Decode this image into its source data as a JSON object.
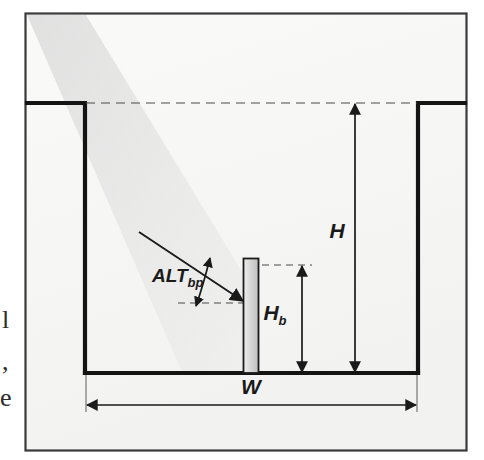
{
  "figure": {
    "background_color": "#ffffff",
    "frame_color": "#2b2b2b",
    "ink_color": "#1a1a1a",
    "sunbeam_color": "#e2e2e2",
    "building_fill_color": "#cfcfcf",
    "paper_tint": "#f6f6f4"
  },
  "labels": {
    "canyon_height": {
      "symbol": "H",
      "subscript": "",
      "name": "canyon height"
    },
    "building_height": {
      "symbol": "H",
      "subscript": "b",
      "name": "building height"
    },
    "canyon_width": {
      "symbol": "W",
      "subscript": "",
      "name": "canyon width"
    },
    "solar_altitude": {
      "symbol": "ALT",
      "subscript": "bp",
      "name": "solar altitude angle at building point"
    }
  },
  "elements": {
    "sun_ray": "incident solar beam",
    "angle_arc": "solar altitude angle arc",
    "rim_dashed_line": "canyon rim reference line",
    "building_top_dashed_line": "building top reference line",
    "ground_dashed_line": "ground reference line at building base",
    "left_wall": "left canyon wall",
    "right_wall": "right canyon wall",
    "canyon_floor": "canyon floor",
    "building": "building block"
  },
  "margin_text": {
    "fragment_1": "l",
    "fragment_2": ",",
    "fragment_3": "e"
  }
}
